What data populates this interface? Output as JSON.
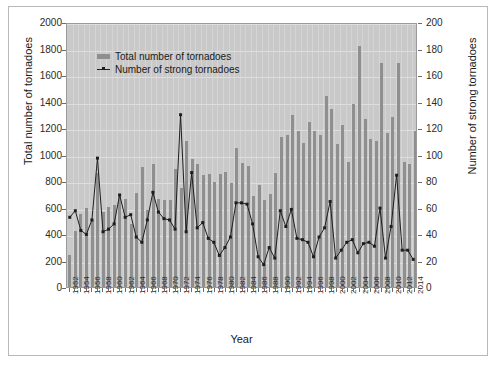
{
  "chart_data": {
    "type": "bar",
    "title": "",
    "xlabel": "Year",
    "ylabel": "Total number of tornadoes",
    "ylabel_right": "Number of strong tornadoes",
    "ylim": [
      0,
      2000
    ],
    "ylim_right": [
      0,
      200
    ],
    "ytick_step": 200,
    "ytick_step_right": 20,
    "grid": true,
    "legend_position": "top-left-inside",
    "yticks": [
      0,
      200,
      400,
      600,
      800,
      1000,
      1200,
      1400,
      1600,
      1800,
      2000
    ],
    "yticks_right": [
      0,
      20,
      40,
      60,
      80,
      100,
      120,
      140,
      160,
      180,
      200
    ],
    "xticks": [
      1952,
      1954,
      1956,
      1958,
      1960,
      1962,
      1964,
      1966,
      1968,
      1970,
      1972,
      1974,
      1976,
      1978,
      1980,
      1982,
      1984,
      1986,
      1988,
      1990,
      1992,
      1994,
      1996,
      1998,
      2000,
      2002,
      2004,
      2006,
      2008,
      2010,
      2012,
      2014
    ],
    "categories": [
      1952,
      1953,
      1954,
      1955,
      1956,
      1957,
      1958,
      1959,
      1960,
      1961,
      1962,
      1963,
      1964,
      1965,
      1966,
      1967,
      1968,
      1969,
      1970,
      1971,
      1972,
      1973,
      1974,
      1975,
      1976,
      1977,
      1978,
      1979,
      1980,
      1981,
      1982,
      1983,
      1984,
      1985,
      1986,
      1987,
      1988,
      1989,
      1990,
      1991,
      1992,
      1993,
      1994,
      1995,
      1996,
      1997,
      1998,
      1999,
      2000,
      2001,
      2002,
      2003,
      2004,
      2005,
      2006,
      2007,
      2008,
      2009,
      2010,
      2011,
      2012,
      2013,
      2014
    ],
    "series": [
      {
        "name": "Total number of tornadoes",
        "axis": "left",
        "render": "bar",
        "color": "#8f8f8f",
        "values": [
          240,
          425,
          550,
          595,
          505,
          860,
          565,
          605,
          620,
          700,
          665,
          475,
          710,
          905,
          585,
          930,
          665,
          660,
          655,
          890,
          745,
          1105,
          965,
          925,
          845,
          855,
          790,
          855,
          870,
          785,
          1050,
          935,
          910,
          690,
          770,
          660,
          705,
          860,
          1135,
          1145,
          1300,
          1180,
          1090,
          1245,
          1175,
          1150,
          1440,
          1345,
          1080,
          1220,
          945,
          1380,
          1820,
          1265,
          1115,
          1100,
          1690,
          1160,
          1285,
          1690,
          945,
          925,
          1180
        ]
      },
      {
        "name": "Number of strong tornadoes",
        "axis": "right",
        "render": "line",
        "color": "#1d1d1d",
        "values": [
          53,
          58,
          43,
          40,
          51,
          98,
          42,
          44,
          48,
          70,
          53,
          55,
          38,
          34,
          51,
          72,
          57,
          52,
          51,
          44,
          131,
          42,
          87,
          45,
          49,
          37,
          34,
          24,
          30,
          38,
          64,
          64,
          63,
          48,
          23,
          17,
          30,
          22,
          58,
          46,
          59,
          37,
          36,
          34,
          23,
          38,
          45,
          65,
          22,
          28,
          34,
          36,
          26,
          33,
          34,
          31,
          60,
          22,
          46,
          85,
          28,
          28,
          21
        ]
      }
    ]
  },
  "legend": {
    "items": [
      {
        "label": "Total number of tornadoes",
        "marker": "bar-swatch"
      },
      {
        "label": "Number of strong tornadoes",
        "marker": "line-marker"
      }
    ]
  },
  "axes": {
    "left_title": "Total number of tornadoes",
    "right_title": "Number of strong tornadoes",
    "x_title": "Year"
  },
  "colors": {
    "plot_background": "#c9c9c9",
    "bar": "#8f8f8f",
    "line": "#1d1d1d",
    "gridline": "#dedede",
    "frame": "#b9b9b9"
  }
}
